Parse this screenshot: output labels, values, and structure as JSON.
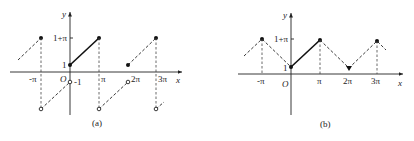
{
  "figure_a": {
    "caption": "(a)",
    "axis_x_label": "x",
    "axis_y_label": "y",
    "origin_label": "O",
    "y_ticks": {
      "one": "1",
      "one_plus_pi": "1+π",
      "neg_one": "-1"
    },
    "x_ticks": {
      "neg_pi": "-π",
      "pi": "π",
      "two_pi": "2π",
      "three_pi": "3π"
    }
  },
  "figure_b": {
    "caption": "(b)",
    "axis_x_label": "x",
    "axis_y_label": "y",
    "origin_label": "O",
    "y_ticks": {
      "one": "1",
      "one_plus_pi": "1+π"
    },
    "x_ticks": {
      "neg_pi": "-π",
      "pi": "π",
      "two_pi": "2π",
      "three_pi": "3π"
    }
  },
  "colors": {
    "ink": "#222222",
    "background": "#ffffff"
  }
}
